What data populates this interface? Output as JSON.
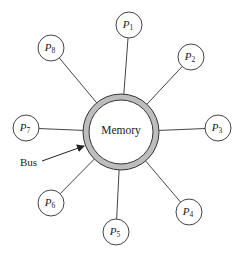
{
  "diagram": {
    "type": "shared-memory bus topology",
    "memory": {
      "label": "Memory",
      "center": [
        121,
        132
      ],
      "outer_radius": 38,
      "inner_radius": 32,
      "ring_color": "#bdbdbd",
      "stroke_color": "#333333"
    },
    "bus": {
      "label": "Bus",
      "label_pos": [
        20,
        166
      ],
      "arrow_from": [
        42,
        161
      ],
      "arrow_to": [
        84,
        146
      ]
    },
    "processor_radius": 13,
    "processors": [
      {
        "id": "P1",
        "base": "P",
        "sub": "1",
        "center": [
          129,
          25
        ]
      },
      {
        "id": "P2",
        "base": "P",
        "sub": "2",
        "center": [
          191,
          57
        ]
      },
      {
        "id": "P3",
        "base": "P",
        "sub": "3",
        "center": [
          218,
          128
        ]
      },
      {
        "id": "P4",
        "base": "P",
        "sub": "4",
        "center": [
          189,
          212
        ]
      },
      {
        "id": "P5",
        "base": "P",
        "sub": "5",
        "center": [
          116,
          232
        ]
      },
      {
        "id": "P6",
        "base": "P",
        "sub": "6",
        "center": [
          51,
          203
        ]
      },
      {
        "id": "P7",
        "base": "P",
        "sub": "7",
        "center": [
          26,
          128
        ]
      },
      {
        "id": "P8",
        "base": "P",
        "sub": "8",
        "center": [
          51,
          48
        ]
      }
    ],
    "edges": [
      {
        "from": "P1",
        "to": "Memory"
      },
      {
        "from": "P2",
        "to": "Memory"
      },
      {
        "from": "P3",
        "to": "Memory"
      },
      {
        "from": "P4",
        "to": "Memory"
      },
      {
        "from": "P5",
        "to": "Memory"
      },
      {
        "from": "P6",
        "to": "Memory"
      },
      {
        "from": "P7",
        "to": "Memory"
      },
      {
        "from": "P8",
        "to": "Memory"
      }
    ]
  }
}
